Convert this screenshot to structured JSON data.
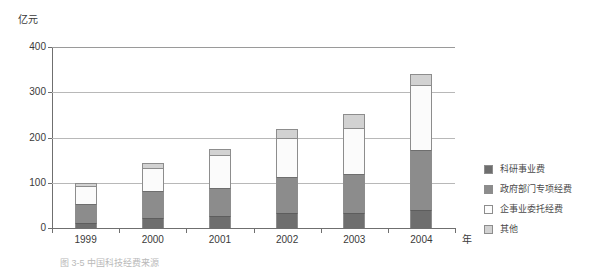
{
  "chart_data": {
    "type": "bar",
    "subtype": "stacked-column",
    "title": "",
    "xlabel": "年",
    "ylabel": "亿元",
    "categories": [
      "1999",
      "2000",
      "2001",
      "2002",
      "2003",
      "2004"
    ],
    "ylim": [
      0,
      400
    ],
    "yticks": [
      0,
      100,
      200,
      300,
      400
    ],
    "ytick_labels": [
      "0",
      "100",
      "200",
      "300",
      "400"
    ],
    "grid": "horizontal",
    "legend_position": "right",
    "series": [
      {
        "name": "科研事业费",
        "color": "#6e6e6e",
        "values": [
          12,
          22,
          27,
          33,
          33,
          40
        ]
      },
      {
        "name": "政府部门专项经费",
        "color": "#8c8c8c",
        "values": [
          40,
          60,
          62,
          80,
          87,
          132
        ]
      },
      {
        "name": "企事业委托经费",
        "color": "#fbfbfb",
        "values": [
          40,
          50,
          72,
          85,
          102,
          145
        ]
      },
      {
        "name": "其他",
        "color": "#d2d2d2",
        "values": [
          8,
          11,
          13,
          21,
          30,
          23
        ]
      }
    ],
    "totals": [
      100,
      143,
      174,
      219,
      252,
      340
    ]
  },
  "caption": "图 3-5  中国科技经费来源"
}
